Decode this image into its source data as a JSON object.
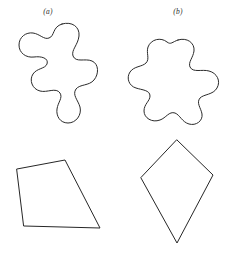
{
  "figure": {
    "background_color": "#ffffff",
    "stroke_color": "#262626",
    "fill_color": "#ffffff",
    "labels": {
      "column_a": "(a)",
      "column_b": "(b)"
    },
    "shapes": {
      "blob_a": {
        "name": "irregular-closed-curve-tall",
        "description": "tall lobed amoeba-like closed curve",
        "path": "M 62 24 C 72 21 80 27 79 36 C 78 45 71 50 73 56 C 76 63 85 58 92 61 C 99 64 99 74 94 80 C 89 86 80 84 76 89 C 72 95 78 100 80 107 C 82 115 76 123 68 123 C 60 123 56 116 57 109 C 58 102 63 98 60 93 C 56 87 47 93 40 91 C 32 89 29 80 33 74 C 37 68 45 69 47 64 C 49 58 41 56 34 57 C 26 58 19 53 19 45 C 19 37 26 32 33 33 C 40 34 44 40 49 38 C 55 36 52 27 62 24 Z"
      },
      "blob_b": {
        "name": "irregular-closed-curve-wide",
        "description": "wide lobed amoeba-like closed curve",
        "path": "M 178 40 C 187 37 195 43 194 51 C 193 58 188 62 190 67 C 193 73 202 69 209 71 C 217 73 221 81 217 88 C 213 95 204 94 200 98 C 196 103 201 108 202 114 C 203 121 196 126 189 124 C 182 122 180 115 175 113 C 169 111 166 118 160 120 C 152 123 144 118 144 111 C 144 104 150 101 150 96 C 150 90 142 90 136 88 C 129 86 126 78 130 72 C 134 66 142 67 146 63 C 150 59 146 53 148 47 C 151 39 161 37 167 42 C 171 45 172 42 178 40 Z"
      },
      "quadrilateral_a": {
        "name": "irregular-quadrilateral",
        "description": "slanted trapezoid-like quadrilateral",
        "points": "17,169 65,160 100,228 24,226"
      },
      "quadrilateral_b": {
        "name": "kite-quadrilateral",
        "description": "kite shape with vertical axis of symmetry",
        "points": "177,140 213,175 177,243 141,178"
      }
    }
  }
}
